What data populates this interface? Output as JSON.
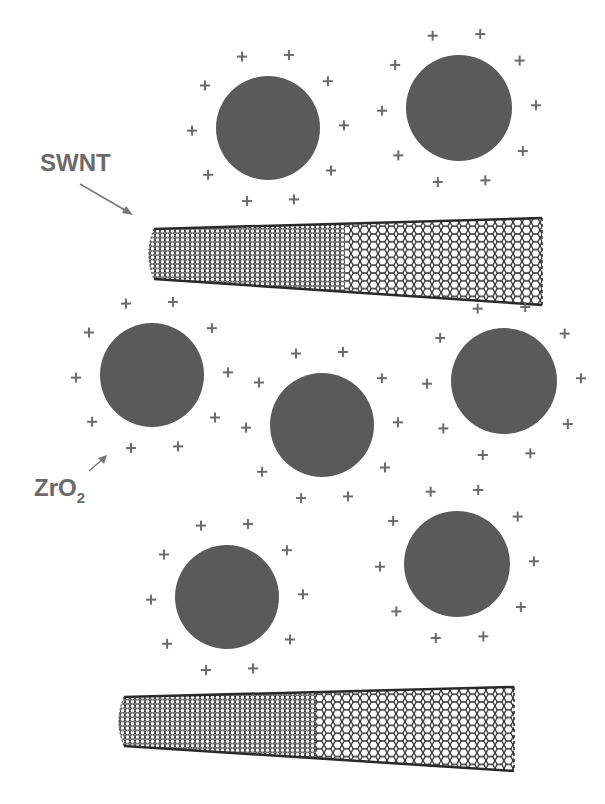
{
  "figure": {
    "labels": {
      "swnt": "SWNT",
      "zro2_main": "ZrO",
      "zro2_sub": "2"
    },
    "colors": {
      "particle": "#5a5a5a",
      "label": "#6a6a6a",
      "charge": "#6b6b6b",
      "tube": "#2a2a2a"
    },
    "charge_symbol": "+",
    "particles": [
      {
        "id": "p1",
        "cx": 268,
        "cy": 128,
        "r": 52
      },
      {
        "id": "p2",
        "cx": 459,
        "cy": 108,
        "r": 53
      },
      {
        "id": "p3",
        "cx": 152,
        "cy": 375,
        "r": 52
      },
      {
        "id": "p4",
        "cx": 322,
        "cy": 425,
        "r": 52
      },
      {
        "id": "p5",
        "cx": 504,
        "cy": 381,
        "r": 53
      },
      {
        "id": "p6",
        "cx": 227,
        "cy": 597,
        "r": 52
      },
      {
        "id": "p7",
        "cx": 457,
        "cy": 564,
        "r": 53
      }
    ],
    "nanotubes": [
      {
        "id": "t1",
        "x1": 148,
        "x2": 542,
        "left_top": 229,
        "left_bottom": 279,
        "right_top": 218,
        "right_bottom": 305
      },
      {
        "id": "t2",
        "x1": 118,
        "x2": 514,
        "left_top": 697,
        "left_bottom": 746,
        "right_top": 687,
        "right_bottom": 771
      }
    ]
  }
}
